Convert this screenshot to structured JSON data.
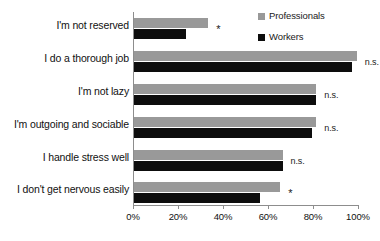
{
  "chart_data": {
    "type": "bar",
    "orientation": "horizontal",
    "title": "",
    "subtitle": "",
    "xlabel": "",
    "ylabel": "",
    "xlim": [
      0,
      100
    ],
    "xtick_labels": [
      "0%",
      "20%",
      "40%",
      "60%",
      "80%",
      "100%"
    ],
    "xtick_values": [
      0,
      20,
      40,
      60,
      80,
      100
    ],
    "grid": false,
    "legend_position": "top-right",
    "categories": [
      "I'm not reserved",
      "I do a thorough job",
      "I'm not lazy",
      "I'm outgoing and sociable",
      "I handle stress well",
      "I don't get nervous easily"
    ],
    "series": [
      {
        "name": "Professionals",
        "color": "#999999",
        "values": [
          33,
          99,
          81,
          81,
          66,
          65
        ]
      },
      {
        "name": "Workers",
        "color": "#0d0d0d",
        "values": [
          23,
          97,
          81,
          79,
          66,
          56
        ]
      }
    ],
    "annotations": [
      "*",
      "n.s.",
      "n.s.",
      "n.s.",
      "n.s.",
      "*"
    ]
  },
  "legend": {
    "items": [
      {
        "label": "Professionals",
        "color": "#999999",
        "marker": "square-swatch-gray"
      },
      {
        "label": "Workers",
        "color": "#0d0d0d",
        "marker": "square-swatch-black"
      }
    ]
  },
  "axis": {
    "ticks": [
      {
        "label": "0%"
      },
      {
        "label": "20%"
      },
      {
        "label": "40%"
      },
      {
        "label": "60%"
      },
      {
        "label": "80%"
      },
      {
        "label": "100%"
      }
    ]
  }
}
